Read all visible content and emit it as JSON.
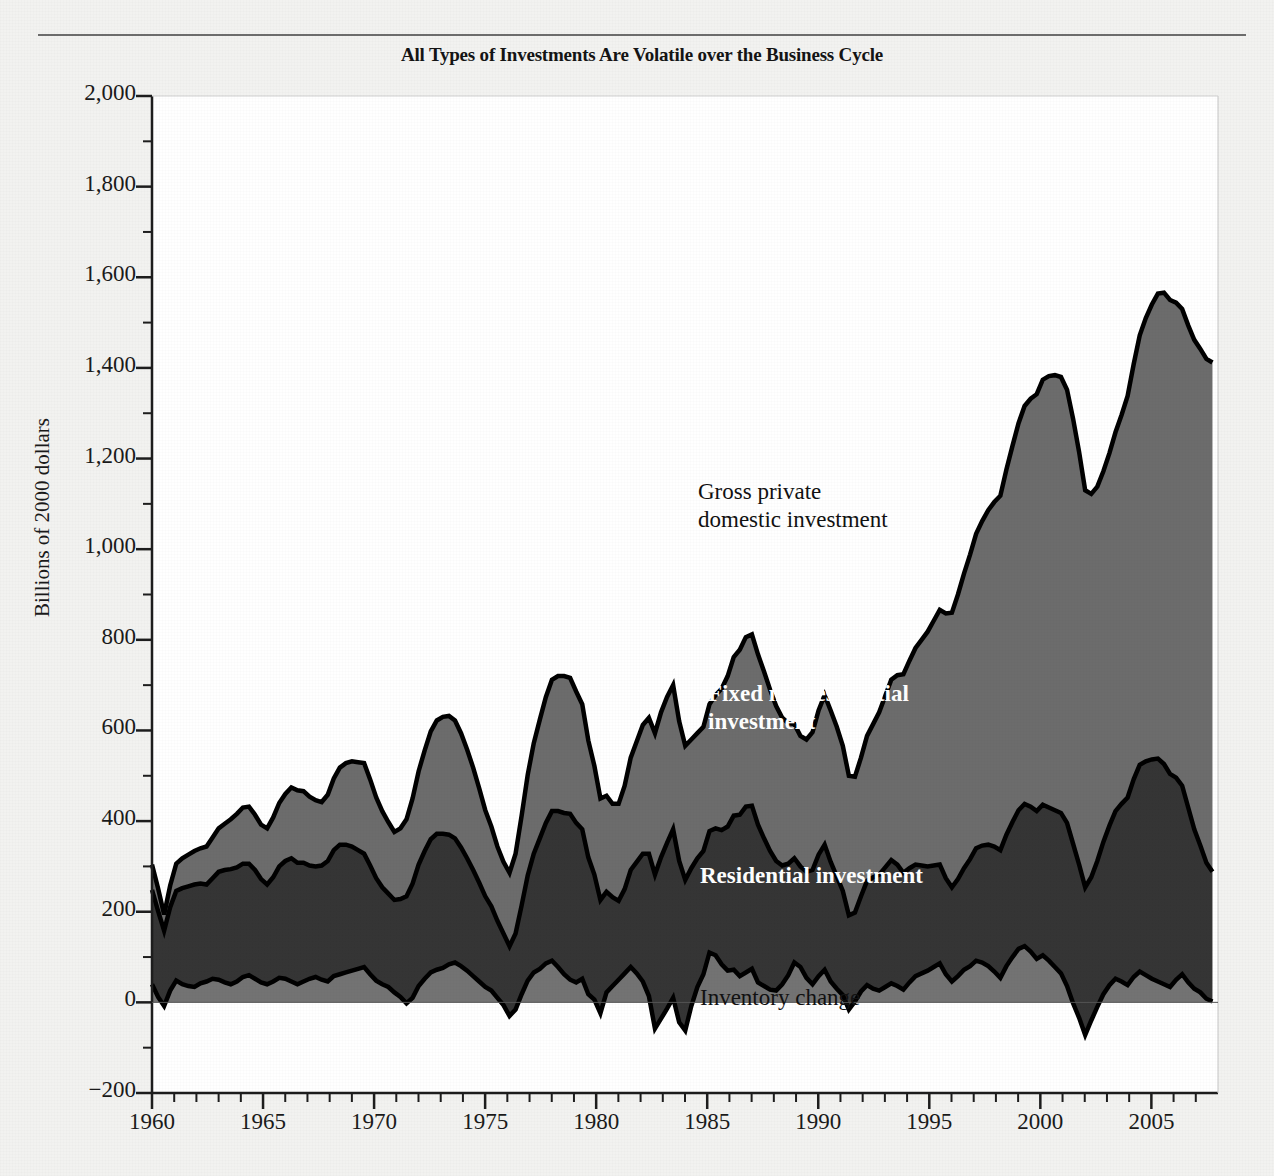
{
  "figure": {
    "title": "All Types of Investments Are Volatile over the Business Cycle",
    "background_color": "#f2f2f0",
    "rule_color": "#6d6d6d"
  },
  "labels": {
    "gross": "Gross private\ndomestic investment",
    "fixed": "Fixed nonresidential\ninvestment",
    "residential": "Residential investment",
    "inventory": "Inventory change"
  },
  "chart_data": {
    "type": "area",
    "stacked": true,
    "title": "All Types of Investments Are Volatile over the Business Cycle",
    "xlabel": "",
    "ylabel": "Billions of 2000 dollars",
    "xlim": [
      1960,
      2008
    ],
    "ylim": [
      -200,
      2000
    ],
    "grid": false,
    "legend_position": "inline-annotations",
    "yticks": [
      -200,
      0,
      200,
      400,
      600,
      800,
      1000,
      1200,
      1400,
      1600,
      1800,
      2000
    ],
    "ytick_labels": [
      "−200",
      "0",
      "200",
      "400",
      "600",
      "800",
      "1,000",
      "1,200",
      "1,400",
      "1,600",
      "1,800",
      "2,000"
    ],
    "ytick_minor_step": 100,
    "xticks": [
      1960,
      1965,
      1970,
      1975,
      1980,
      1985,
      1990,
      1995,
      2000,
      2005
    ],
    "xtick_labels": [
      "1960",
      "1965",
      "1970",
      "1975",
      "1980",
      "1985",
      "1990",
      "1995",
      "2000",
      "2005"
    ],
    "xtick_minor_step": 1,
    "colors": {
      "gross_band": "#6c6c6c",
      "fixed_band": "#353535",
      "residential_band": "#737373",
      "outline": "#000000"
    },
    "series": [
      {
        "name": "Inventory change",
        "band_color": "#737373",
        "note": "bottom band, measured from 0",
        "values": [
          40,
          12,
          -8,
          26,
          48,
          40,
          36,
          34,
          42,
          46,
          52,
          50,
          44,
          40,
          46,
          56,
          60,
          52,
          44,
          40,
          46,
          54,
          52,
          46,
          40,
          46,
          52,
          56,
          50,
          46,
          58,
          62,
          66,
          70,
          74,
          78,
          62,
          48,
          40,
          34,
          22,
          12,
          -2,
          10,
          36,
          52,
          66,
          72,
          76,
          84,
          88,
          80,
          70,
          58,
          46,
          34,
          26,
          10,
          -6,
          -30,
          -16,
          18,
          48,
          66,
          74,
          86,
          92,
          78,
          62,
          50,
          44,
          52,
          18,
          6,
          -24,
          22,
          36,
          50,
          64,
          78,
          64,
          46,
          14,
          -58,
          -36,
          -14,
          10,
          -44,
          -62,
          -8,
          34,
          62,
          110,
          104,
          84,
          70,
          72,
          58,
          66,
          74,
          44,
          36,
          28,
          26,
          40,
          60,
          88,
          78,
          54,
          40,
          58,
          72,
          46,
          30,
          16,
          -16,
          2,
          24,
          38,
          30,
          26,
          34,
          42,
          36,
          28,
          44,
          58,
          64,
          70,
          78,
          86,
          62,
          46,
          58,
          72,
          80,
          92,
          88,
          80,
          68,
          54,
          80,
          100,
          118,
          124,
          112,
          96,
          104,
          92,
          78,
          64,
          36,
          -2,
          -34,
          -72,
          -40,
          -10,
          18,
          38,
          52,
          46,
          38,
          56,
          68,
          60,
          52,
          46,
          40,
          34,
          50,
          62,
          44,
          30,
          22,
          8,
          2
        ]
      },
      {
        "name": "Residential investment",
        "band_color": "#353535",
        "note": "middle band thickness",
        "values": [
          208,
          190,
          166,
          184,
          198,
          212,
          220,
          226,
          220,
          214,
          222,
          238,
          248,
          254,
          252,
          250,
          246,
          240,
          228,
          220,
          230,
          246,
          260,
          272,
          268,
          262,
          250,
          244,
          252,
          266,
          278,
          286,
          282,
          274,
          262,
          250,
          240,
          226,
          214,
          206,
          204,
          216,
          236,
          252,
          268,
          282,
          294,
          300,
          296,
          286,
          274,
          262,
          248,
          234,
          218,
          200,
          186,
          170,
          158,
          154,
          168,
          196,
          232,
          262,
          288,
          310,
          330,
          344,
          356,
          366,
          352,
          330,
          302,
          276,
          250,
          222,
          196,
          174,
          186,
          214,
          246,
          282,
          314,
          340,
          356,
          366,
          372,
          356,
          332,
          304,
          284,
          272,
          268,
          280,
          296,
          318,
          340,
          356,
          366,
          360,
          348,
          326,
          306,
          286,
          262,
          246,
          230,
          222,
          234,
          252,
          268,
          276,
          264,
          248,
          230,
          208,
          196,
          210,
          230,
          246,
          256,
          264,
          272,
          268,
          258,
          252,
          246,
          238,
          230,
          224,
          218,
          212,
          208,
          214,
          224,
          236,
          248,
          258,
          268,
          276,
          282,
          290,
          298,
          306,
          314,
          320,
          326,
          332,
          338,
          346,
          354,
          360,
          352,
          338,
          326,
          316,
          322,
          336,
          352,
          370,
          392,
          414,
          436,
          456,
          472,
          484,
          492,
          486,
          470,
          446,
          416,
          386,
          352,
          324,
          300,
          286
        ]
      },
      {
        "name": "Fixed nonresidential investment",
        "band_color": "#6c6c6c",
        "note": "top band thickness (gross private domestic investment minus lower bands)",
        "values": [
          56,
          50,
          36,
          48,
          60,
          66,
          70,
          74,
          78,
          84,
          90,
          96,
          102,
          110,
          118,
          124,
          126,
          122,
          120,
          124,
          132,
          140,
          148,
          156,
          160,
          158,
          152,
          146,
          140,
          146,
          158,
          170,
          180,
          188,
          194,
          200,
          190,
          178,
          168,
          158,
          150,
          156,
          170,
          188,
          206,
          222,
          238,
          250,
          258,
          262,
          260,
          252,
          240,
          226,
          208,
          190,
          176,
          164,
          158,
          162,
          176,
          198,
          222,
          244,
          262,
          278,
          290,
          298,
          302,
          300,
          290,
          276,
          258,
          240,
          224,
          212,
          206,
          214,
          228,
          248,
          266,
          284,
          300,
          312,
          320,
          322,
          318,
          308,
          296,
          284,
          276,
          274,
          280,
          294,
          312,
          332,
          350,
          364,
          374,
          378,
          376,
          368,
          356,
          342,
          326,
          310,
          296,
          288,
          292,
          304,
          318,
          330,
          334,
          330,
          320,
          308,
          300,
          306,
          320,
          338,
          358,
          378,
          398,
          418,
          438,
          458,
          478,
          498,
          518,
          540,
          562,
          584,
          606,
          628,
          650,
          672,
          694,
          716,
          738,
          760,
          782,
          806,
          830,
          854,
          878,
          900,
          920,
          938,
          952,
          960,
          962,
          956,
          938,
          910,
          876,
          846,
          826,
          818,
          822,
          836,
          858,
          886,
          916,
          948,
          978,
          1004,
          1026,
          1040,
          1046,
          1048,
          1052,
          1064,
          1080,
          1096,
          1112,
          1124
        ]
      }
    ],
    "totals_note": "Top outline = gross private domestic investment; peaks near 1,950 in 2006, trough near 190 in 1961",
    "quarters_per_year": 4,
    "start_year": 1960,
    "end_year": 2007.75
  }
}
